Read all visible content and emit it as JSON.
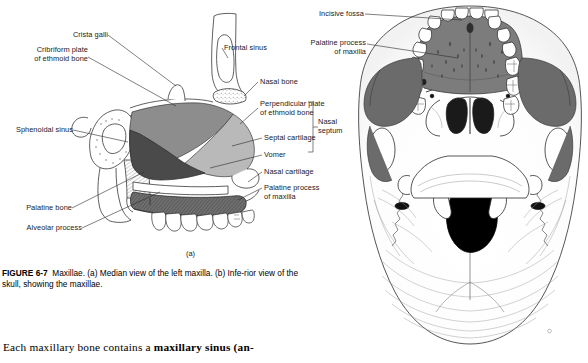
{
  "figure": {
    "number": "FIGURE 6-7",
    "title": "Maxillae.",
    "caption_rest": " (a) Median view of the left maxilla. (b) Infe-rior view of the skull, showing the maxillae.",
    "panel_a_letter": "(a)"
  },
  "panel_a": {
    "name": "median-view-left-maxilla",
    "labels": [
      {
        "id": "crista-galli",
        "text": "Crista galli"
      },
      {
        "id": "cribriform-plate",
        "text": "Cribriform plate\nof ethmoid bone"
      },
      {
        "id": "sphenoidal-sinus",
        "text": "Sphenoidal sinus"
      },
      {
        "id": "palatine-bone",
        "text": "Palatine bone"
      },
      {
        "id": "alveolar-process",
        "text": "Alveolar process"
      },
      {
        "id": "frontal-sinus",
        "text": "Frontal sinus"
      },
      {
        "id": "nasal-bone",
        "text": "Nasal bone"
      },
      {
        "id": "perpendicular-plate",
        "text": "Perpendicular plate\nof ethmoid bone"
      },
      {
        "id": "septal-cartilage",
        "text": "Septal cartilage"
      },
      {
        "id": "vomer",
        "text": "Vomer"
      },
      {
        "id": "nasal-cartilage",
        "text": "Nasal cartilage"
      },
      {
        "id": "palatine-process",
        "text": "Palatine process\nof maxilla"
      },
      {
        "id": "nasal-septum",
        "text": "Nasal\nseptum"
      }
    ],
    "region_colors": {
      "perpendicular_plate": "#8d8d8d",
      "septal_cartilage": "#b9b9b9",
      "vomer": "#4a4a4a",
      "hard_palate": "#6f6f6f",
      "bone_outline": "#2b2b2b"
    }
  },
  "panel_b": {
    "name": "inferior-view-skull",
    "labels": [
      {
        "id": "incisive-fossa",
        "text": "Incisive fossa"
      },
      {
        "id": "palatine-process",
        "text": "Palatine process\nof maxilla"
      }
    ],
    "region_colors": {
      "hard_palate": "#7c7c7c",
      "zygomatic_shadow": "#6b6b6b",
      "foramen_magnum": "#000000",
      "bone_outline": "#2b2b2b"
    }
  },
  "body": {
    "paragraph_prefix": "Each maxillary bone contains a ",
    "paragraph_bold": "maxillary sinus (an-"
  }
}
